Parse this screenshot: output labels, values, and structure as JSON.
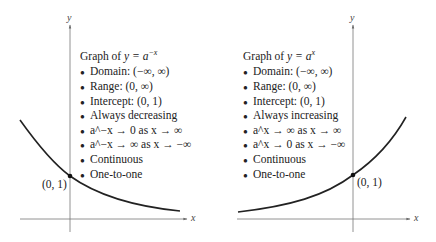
{
  "left": {
    "title": "Graph of y = a^−x",
    "title_prefix": "Graph of ",
    "title_math": "y = a",
    "title_exp": "−x",
    "items": [
      "Domain:  (−∞, ∞)",
      "Range:  (0, ∞)",
      "Intercept:  (0, 1)",
      "Always decreasing",
      "a^−x → 0 as x → ∞",
      "a^−x → ∞ as x → −∞",
      "Continuous",
      "One-to-one"
    ],
    "point_label": "(0, 1)",
    "x_axis_label": "x",
    "y_axis_label": "y"
  },
  "right": {
    "title": "Graph of y = a^x",
    "title_prefix": "Graph of ",
    "title_math": "y = a",
    "title_exp": "x",
    "items": [
      "Domain:  (−∞, ∞)",
      "Range:  (0, ∞)",
      "Intercept:  (0, 1)",
      "Always increasing",
      "a^x → ∞ as x → ∞",
      "a^x → 0 as x → −∞",
      "Continuous",
      "One-to-one"
    ],
    "point_label": "(0, 1)",
    "x_axis_label": "x",
    "y_axis_label": "y"
  }
}
